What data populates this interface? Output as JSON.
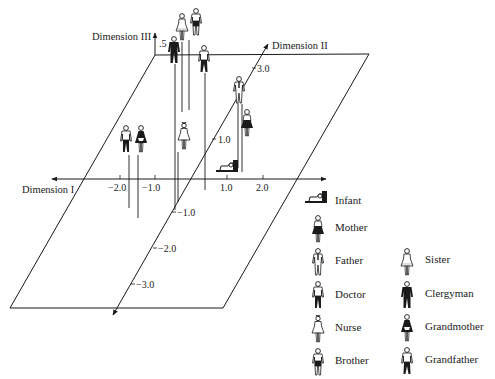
{
  "diagram": {
    "type": "3d-scatter-pictogram",
    "axes": {
      "dim1": {
        "label": "Dimension I",
        "ticks": [
          "−2.0",
          "−1.0",
          "1.0",
          "2.0"
        ]
      },
      "dim2": {
        "label": "Dimension II",
        "ticks_pos": [
          "1.0",
          "3.0"
        ],
        "ticks_neg": [
          "−1.0",
          "−2.0",
          "−3.0"
        ]
      },
      "dim3": {
        "label": "Dimension III",
        "tick": ".5"
      }
    },
    "points": [
      {
        "name": "Sister",
        "icon": "sister-icon"
      },
      {
        "name": "Brother",
        "icon": "brother-icon"
      },
      {
        "name": "Clergyman",
        "icon": "clergyman-icon"
      },
      {
        "name": "Grandfather",
        "icon": "grandfather-icon"
      },
      {
        "name": "Father",
        "icon": "father-icon"
      },
      {
        "name": "Mother",
        "icon": "mother-icon"
      },
      {
        "name": "Infant",
        "icon": "infant-icon"
      },
      {
        "name": "Doctor",
        "icon": "doctor-icon"
      },
      {
        "name": "Grandmother",
        "icon": "grandmother-icon"
      },
      {
        "name": "Nurse",
        "icon": "nurse-icon"
      }
    ]
  },
  "legend": {
    "col1": [
      "Infant",
      "Mother",
      "Father",
      "Doctor",
      "Nurse",
      "Brother"
    ],
    "col2": [
      "Sister",
      "Clergyman",
      "Grandmother",
      "Grandfather"
    ]
  },
  "colors": {
    "ink": "#1a1a1a",
    "background": "#ffffff"
  }
}
